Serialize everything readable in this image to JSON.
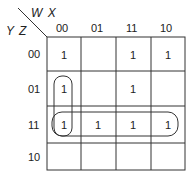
{
  "kmap": {
    "col_var": "W X",
    "row_var": "Y Z",
    "col_labels": [
      "00",
      "01",
      "11",
      "10"
    ],
    "row_labels": [
      "00",
      "01",
      "11",
      "10"
    ],
    "cells": [
      [
        "1",
        "",
        "1",
        "1"
      ],
      [
        "1",
        "",
        "1",
        ""
      ],
      [
        "1",
        "1",
        "1",
        "1"
      ],
      [
        "",
        "",
        "",
        ""
      ]
    ],
    "groups": [
      {
        "name": "column-00-rows-01-11",
        "cells": [
          [
            1,
            0
          ],
          [
            2,
            0
          ]
        ]
      },
      {
        "name": "row-11-all",
        "cells": [
          [
            2,
            0
          ],
          [
            2,
            1
          ],
          [
            2,
            2
          ],
          [
            2,
            3
          ]
        ]
      }
    ]
  }
}
